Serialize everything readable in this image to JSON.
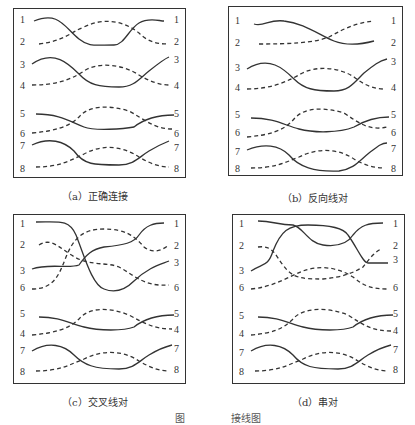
{
  "figure": {
    "caption_visible": "图 ... 接线图",
    "caption_prefix": "图",
    "caption_suffix": "接线图"
  },
  "panels": [
    {
      "id": "a",
      "caption": "（a）正确连接",
      "left_pins": [
        "1",
        "2",
        "3",
        "4",
        "5",
        "6",
        "7",
        "8"
      ],
      "right_pins": [
        "1",
        "2",
        "3",
        "4",
        "5",
        "6",
        "7",
        "8"
      ]
    },
    {
      "id": "b",
      "caption": "（b）反向线对",
      "left_pins": [
        "1",
        "2",
        "3",
        "4",
        "5",
        "6",
        "7",
        "8"
      ],
      "right_pins": [
        "1",
        "2",
        "3",
        "4",
        "5",
        "6",
        "7",
        "8"
      ]
    },
    {
      "id": "c",
      "caption": "（c）交叉线对",
      "left_pins": [
        "1",
        "2",
        "3",
        "6",
        "5",
        "4",
        "7",
        "8"
      ],
      "right_pins": [
        "1",
        "2",
        "3",
        "6",
        "5",
        "4",
        "7",
        "8"
      ]
    },
    {
      "id": "d",
      "caption": "（d）串对",
      "left_pins": [
        "1",
        "2",
        "3",
        "6",
        "5",
        "4",
        "7",
        "8"
      ],
      "right_pins": [
        "1",
        "2",
        "3",
        "6",
        "5",
        "4",
        "7",
        "8"
      ]
    }
  ],
  "legend": {
    "solid_line": "solid wire",
    "dashed_line": "dashed wire"
  }
}
